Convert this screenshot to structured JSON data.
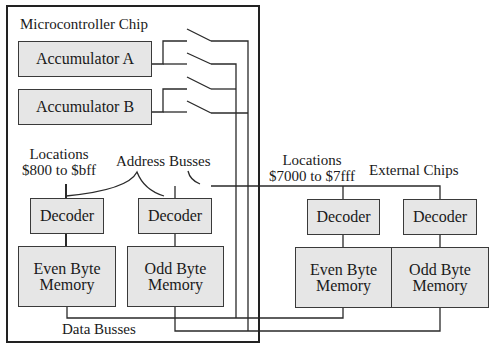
{
  "diagram": {
    "chip_title": "Microcontroller Chip",
    "accumulators": [
      {
        "label": "Accumulator A"
      },
      {
        "label": "Accumulator B"
      }
    ],
    "internal": {
      "locations_line1": "Locations",
      "locations_line2": "$800 to $bff",
      "address_busses": "Address Busses",
      "decoders": [
        {
          "label": "Decoder"
        },
        {
          "label": "Decoder"
        }
      ],
      "memories": [
        {
          "line1": "Even Byte",
          "line2": "Memory"
        },
        {
          "line1": "Odd Byte",
          "line2": "Memory"
        }
      ]
    },
    "external": {
      "locations_line1": "Locations",
      "locations_line2": "$7000 to $7fff",
      "title": "External Chips",
      "decoders": [
        {
          "label": "Decoder"
        },
        {
          "label": "Decoder"
        }
      ],
      "memories": [
        {
          "line1": "Even Byte",
          "line2": "Memory"
        },
        {
          "line1": "Odd Byte",
          "line2": "Memory"
        }
      ]
    },
    "data_busses": "Data Busses",
    "colors": {
      "box_fill": "#e6e6e6",
      "line": "#2a2a2a",
      "background": "#ffffff"
    }
  }
}
